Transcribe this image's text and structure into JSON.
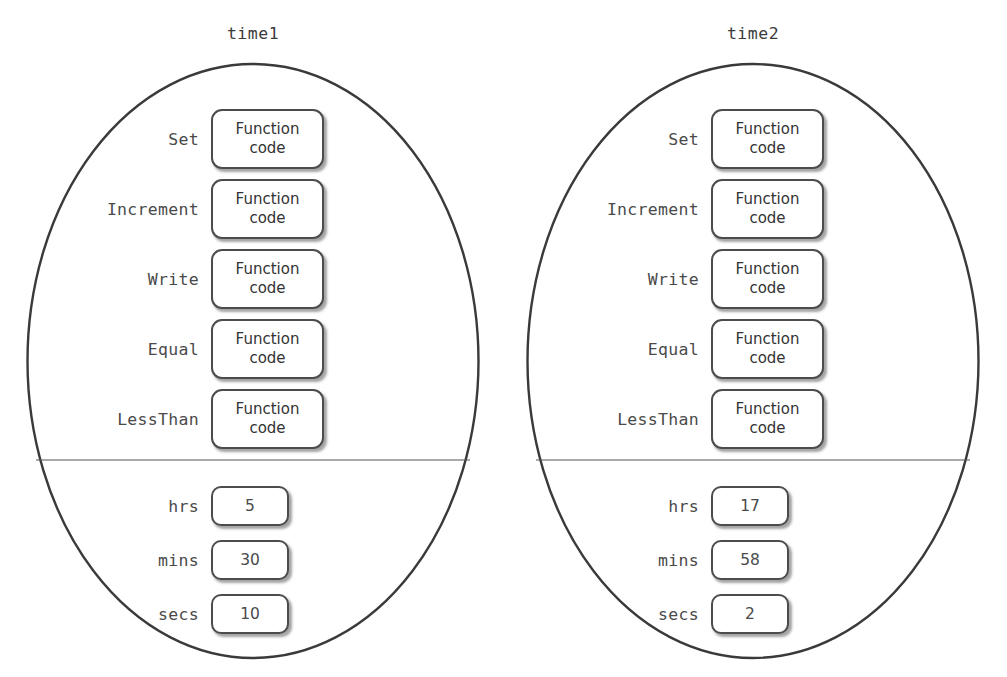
{
  "diagram": {
    "type": "object-diagram",
    "object_count": 2,
    "divider_present": true
  },
  "objects": [
    {
      "id": "time1",
      "title": "time1",
      "methods": [
        {
          "name": "Set",
          "body_line1": "Function",
          "body_line2": "code"
        },
        {
          "name": "Increment",
          "body_line1": "Function",
          "body_line2": "code"
        },
        {
          "name": "Write",
          "body_line1": "Function",
          "body_line2": "code"
        },
        {
          "name": "Equal",
          "body_line1": "Function",
          "body_line2": "code"
        },
        {
          "name": "LessThan",
          "body_line1": "Function",
          "body_line2": "code"
        }
      ],
      "attributes": [
        {
          "name": "hrs",
          "value": "5"
        },
        {
          "name": "mins",
          "value": "30"
        },
        {
          "name": "secs",
          "value": "10"
        }
      ]
    },
    {
      "id": "time2",
      "title": "time2",
      "methods": [
        {
          "name": "Set",
          "body_line1": "Function",
          "body_line2": "code"
        },
        {
          "name": "Increment",
          "body_line1": "Function",
          "body_line2": "code"
        },
        {
          "name": "Write",
          "body_line1": "Function",
          "body_line2": "code"
        },
        {
          "name": "Equal",
          "body_line1": "Function",
          "body_line2": "code"
        },
        {
          "name": "LessThan",
          "body_line1": "Function",
          "body_line2": "code"
        }
      ],
      "attributes": [
        {
          "name": "hrs",
          "value": "17"
        },
        {
          "name": "mins",
          "value": "58"
        },
        {
          "name": "secs",
          "value": "2"
        }
      ]
    }
  ],
  "colors": {
    "background": "#ffffff",
    "outline": "#3a3a3a",
    "box_border": "#4c4c4c",
    "text": "#3b3b3b",
    "label_text": "#4a4a4a",
    "divider": "#555555"
  }
}
